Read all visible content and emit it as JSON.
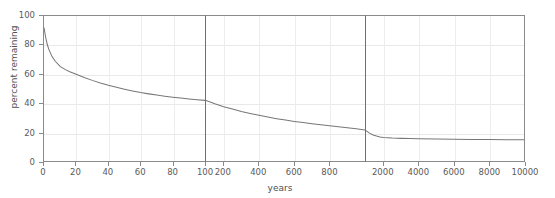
{
  "chart_data": {
    "type": "line",
    "title": "",
    "xlabel": "years",
    "ylabel": "percent remaining",
    "ylim": [
      0,
      100
    ],
    "yticks": [
      0,
      20,
      40,
      60,
      80,
      100
    ],
    "grid": true,
    "legend": null,
    "broken_axis": true,
    "panels": [
      {
        "name": "panel-0-100-years",
        "xlim": [
          0,
          100
        ],
        "xticks": [
          0,
          20,
          40,
          60,
          80,
          100
        ],
        "x": [
          0,
          1,
          2,
          3,
          5,
          7,
          10,
          13,
          16,
          20,
          25,
          30,
          35,
          40,
          45,
          50,
          55,
          60,
          65,
          70,
          75,
          80,
          85,
          90,
          95,
          100
        ],
        "y": [
          92.0,
          85.5,
          80.5,
          77.0,
          72.0,
          68.8,
          65.3,
          63.2,
          61.6,
          59.8,
          57.6,
          55.6,
          53.8,
          52.2,
          50.8,
          49.5,
          48.3,
          47.2,
          46.3,
          45.5,
          44.7,
          44.0,
          43.4,
          42.8,
          42.3,
          41.8
        ]
      },
      {
        "name": "panel-100-1000-years",
        "xlim": [
          100,
          1000
        ],
        "xticks": [
          200,
          400,
          600,
          800
        ],
        "x": [
          100,
          150,
          200,
          250,
          300,
          350,
          400,
          450,
          500,
          550,
          600,
          650,
          700,
          750,
          800,
          850,
          900,
          950,
          1000
        ],
        "y": [
          41.8,
          39.5,
          37.5,
          35.8,
          34.2,
          32.8,
          31.5,
          30.3,
          29.2,
          28.2,
          27.3,
          26.5,
          25.7,
          25.0,
          24.3,
          23.6,
          22.9,
          22.2,
          21.4
        ]
      },
      {
        "name": "panel-1000-10000-years",
        "xlim": [
          1000,
          10000
        ],
        "xticks": [
          2000,
          4000,
          6000,
          8000,
          10000
        ],
        "x": [
          1000,
          1200,
          1400,
          1600,
          1800,
          2000,
          2500,
          3000,
          3500,
          4000,
          5000,
          6000,
          7000,
          8000,
          9000,
          10000
        ],
        "y": [
          21.0,
          19.2,
          18.0,
          17.2,
          16.6,
          16.2,
          15.8,
          15.6,
          15.5,
          15.4,
          15.2,
          15.0,
          14.9,
          14.8,
          14.7,
          14.6
        ]
      }
    ],
    "colors": {
      "line": "#777777",
      "grid": "#e9e9e9",
      "axis": "#8a8a8a",
      "divider": "#6f6f6f",
      "tick_text": "#5a5a5a",
      "background": "#ffffff"
    }
  }
}
